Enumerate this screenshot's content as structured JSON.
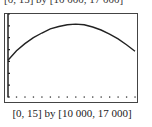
{
  "top_caption": "[0, 15] by [10 000, 17 000]",
  "caption": "[0, 15] by [10 000, 17 000]",
  "chart_data": {
    "type": "line",
    "title": "",
    "xlabel": "",
    "ylabel": "",
    "xlim": [
      0,
      15
    ],
    "ylim": [
      10000,
      17000
    ],
    "x_ticks": [
      0,
      1,
      2,
      3,
      4,
      5,
      6,
      7,
      8,
      9,
      10,
      11,
      12,
      13,
      14,
      15
    ],
    "y_ticks": [
      10000,
      11000,
      12000,
      13000,
      14000,
      15000,
      16000,
      17000
    ],
    "grid": false,
    "legend": null,
    "x": [
      0,
      1,
      2,
      3,
      4,
      5,
      6,
      7,
      8,
      9,
      10,
      11,
      12,
      13,
      14,
      15
    ],
    "values": [
      13100,
      13900,
      14500,
      15000,
      15400,
      15750,
      15950,
      16100,
      16150,
      16100,
      15900,
      15650,
      15300,
      14900,
      14400,
      13850
    ],
    "caption": "[0, 15] by [10 000, 17 000]"
  }
}
